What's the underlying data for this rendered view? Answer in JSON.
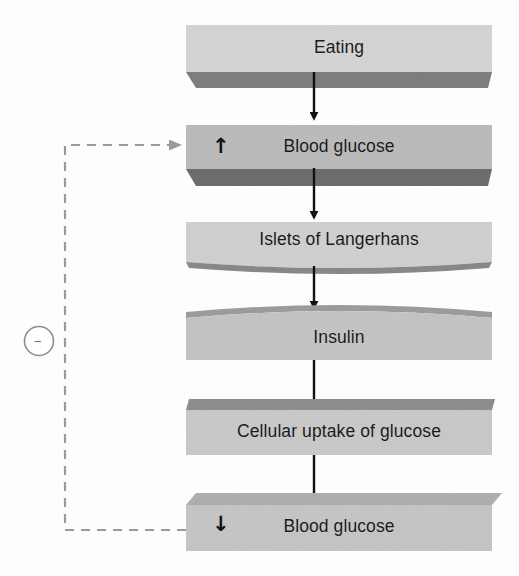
{
  "diagram": {
    "type": "flowchart",
    "orientation": "vertical",
    "colors": {
      "box_light": "#d3d3d3",
      "box_medium": "#bdbdbd",
      "box_dark_face": "#7d7d7d",
      "box_darker_face": "#6b6b6b",
      "arrow": "#111111",
      "feedback_line": "#9a9a9a",
      "text": "#1a1a1a",
      "background": "#fdfdfd"
    },
    "nodes": [
      {
        "id": "eating",
        "label": "Eating",
        "marker": "",
        "marker_name": "none",
        "style": "light-slab-bottom-shadow"
      },
      {
        "id": "blood-glucose-high",
        "label": "Blood glucose",
        "marker": "↑",
        "marker_name": "up-arrow-increase",
        "style": "medium-slab-bottom-shadow"
      },
      {
        "id": "islets-of-langerhans",
        "label": "Islets of Langerhans",
        "marker": "",
        "marker_name": "none",
        "style": "light-slab-curved-bottom"
      },
      {
        "id": "insulin",
        "label": "Insulin",
        "marker": "",
        "marker_name": "none",
        "style": "medium-slab-curved-top"
      },
      {
        "id": "cellular-uptake",
        "label": "Cellular uptake of glucose",
        "marker": "",
        "marker_name": "none",
        "style": "light-slab-dark-top"
      },
      {
        "id": "blood-glucose-low",
        "label": "Blood glucose",
        "marker": "↓",
        "marker_name": "down-arrow-decrease",
        "style": "light-slab-beveled"
      }
    ],
    "connectors": [
      {
        "from": "eating",
        "to": "blood-glucose-high",
        "kind": "solid-arrow-down"
      },
      {
        "from": "blood-glucose-high",
        "to": "islets-of-langerhans",
        "kind": "solid-arrow-down"
      },
      {
        "from": "islets-of-langerhans",
        "to": "insulin",
        "kind": "solid-arrow-down"
      },
      {
        "from": "insulin",
        "to": "cellular-uptake",
        "kind": "solid-arrow-down"
      },
      {
        "from": "cellular-uptake",
        "to": "blood-glucose-low",
        "kind": "solid-arrow-down"
      }
    ],
    "feedback": {
      "from": "blood-glucose-low",
      "to": "blood-glucose-high",
      "kind": "dashed-arrow",
      "sign": "−",
      "sign_name": "minus-sign",
      "sign_description": "negative feedback"
    }
  }
}
